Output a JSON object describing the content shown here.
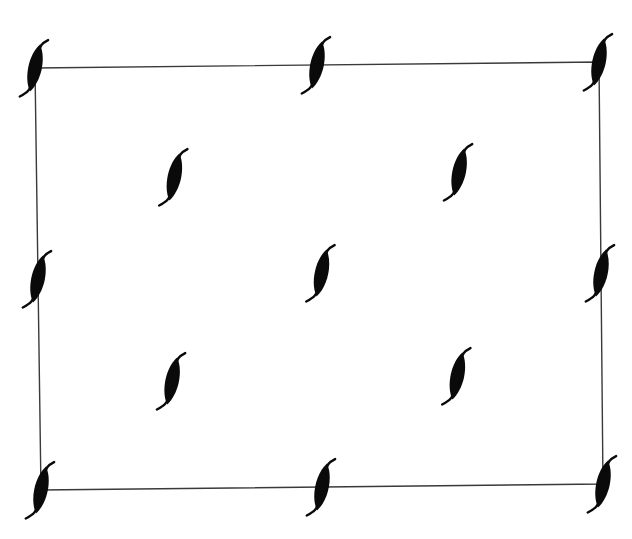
{
  "diagram": {
    "colors": {
      "glyph": "#0a0a0a",
      "edge": "#3a3a3a",
      "background": "#ffffff"
    },
    "grid": {
      "columns": 3,
      "rows": 3
    },
    "nodes": [
      {
        "id": "n-top-left",
        "role": "corner",
        "col": 0,
        "row": 0
      },
      {
        "id": "n-top-mid",
        "role": "edge-mid",
        "col": 1,
        "row": 0
      },
      {
        "id": "n-top-right",
        "role": "corner",
        "col": 2,
        "row": 0
      },
      {
        "id": "n-inner-ul",
        "role": "interior",
        "col": 0.5,
        "row": 0.5
      },
      {
        "id": "n-inner-ur",
        "role": "interior",
        "col": 1.5,
        "row": 0.5
      },
      {
        "id": "n-mid-left",
        "role": "edge-mid",
        "col": 0,
        "row": 1
      },
      {
        "id": "n-center",
        "role": "center",
        "col": 1,
        "row": 1
      },
      {
        "id": "n-mid-right",
        "role": "edge-mid",
        "col": 2,
        "row": 1
      },
      {
        "id": "n-inner-ll",
        "role": "interior",
        "col": 0.5,
        "row": 1.5
      },
      {
        "id": "n-inner-lr",
        "role": "interior",
        "col": 1.5,
        "row": 1.5
      },
      {
        "id": "n-bottom-left",
        "role": "corner",
        "col": 0,
        "row": 2
      },
      {
        "id": "n-bottom-mid",
        "role": "edge-mid",
        "col": 1,
        "row": 2
      },
      {
        "id": "n-bottom-right",
        "role": "corner",
        "col": 2,
        "row": 2
      }
    ]
  }
}
